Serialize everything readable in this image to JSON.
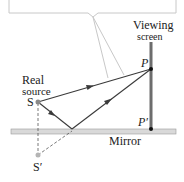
{
  "diagram": {
    "labels": {
      "viewing": "Viewing",
      "screen": "screen",
      "real": "Real",
      "source": "source",
      "s": "S",
      "s_prime": "S′",
      "p": "P",
      "p_prime": "P′",
      "mirror": "Mirror"
    },
    "colors": {
      "ray": "#3a3a3a",
      "screen": "#6d6d6d",
      "mirror_fill": "#d9d9d9",
      "mirror_stroke": "#9a9a9a",
      "callout": "#c8c8c8",
      "point": "#8a8a8a"
    }
  }
}
